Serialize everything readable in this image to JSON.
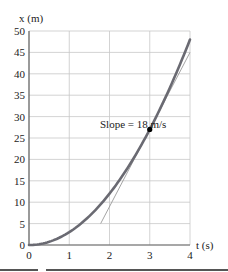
{
  "chart_data": {
    "type": "line",
    "title": "",
    "xlabel": "t (s)",
    "ylabel": "x (m)",
    "xlim": [
      0,
      4
    ],
    "ylim": [
      0,
      50
    ],
    "grid": true,
    "x_ticks": [
      "0",
      "1",
      "2",
      "3",
      "4"
    ],
    "y_ticks": [
      "0",
      "5",
      "10",
      "15",
      "20",
      "25",
      "30",
      "35",
      "40",
      "45",
      "50"
    ],
    "series": [
      {
        "name": "position curve x = 3t^2",
        "x": [
          0,
          0.5,
          1,
          1.5,
          2,
          2.5,
          3,
          3.5,
          4
        ],
        "values": [
          0,
          0.75,
          3,
          6.75,
          12,
          18.75,
          27,
          36.75,
          48
        ],
        "color": "#6a6a72",
        "style": "thick"
      },
      {
        "name": "tangent at t = 3 s",
        "x": [
          1.78,
          4
        ],
        "values": [
          5,
          45
        ],
        "color": "#9a9a9a",
        "style": "thin"
      }
    ],
    "annotations": [
      {
        "text": "Slope = 18 m/s",
        "point": {
          "t": 3,
          "x": 27
        }
      }
    ]
  },
  "labels": {
    "ylabel": "x (m)",
    "xlabel": "t (s)",
    "slope": "Slope = 18 m/s"
  }
}
